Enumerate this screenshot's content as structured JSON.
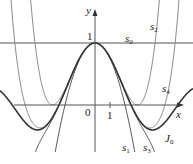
{
  "chart_data": {
    "type": "line",
    "title": "",
    "xlabel": "x",
    "ylabel": "y",
    "xlim": [
      -6.3,
      6.3
    ],
    "ylim": [
      -1.0,
      1.55
    ],
    "grid": false,
    "tick_labels": {
      "origin": "0",
      "x_one": "1",
      "y_one": "1"
    },
    "series": [
      {
        "name": "s0",
        "label": "s",
        "sub": "0",
        "coeffs": [
          1
        ],
        "stroke": "#555555",
        "width": 1.1
      },
      {
        "name": "s1",
        "label": "s",
        "sub": "1",
        "coeffs": [
          1,
          -0.25
        ],
        "stroke": "#555555",
        "width": 1.0
      },
      {
        "name": "s2",
        "label": "s",
        "sub": "2",
        "coeffs": [
          1,
          -0.25,
          0.015625
        ],
        "stroke": "#8a8a8a",
        "width": 1.0
      },
      {
        "name": "s3",
        "label": "s",
        "sub": "3",
        "coeffs": [
          1,
          -0.25,
          0.015625,
          -0.000434028
        ],
        "stroke": "#555555",
        "width": 1.0
      },
      {
        "name": "s4",
        "label": "s",
        "sub": "4",
        "coeffs": [
          1,
          -0.25,
          0.015625,
          -0.000434028,
          6.78168e-06
        ],
        "stroke": "#8a8a8a",
        "width": 1.0
      },
      {
        "name": "J0",
        "label": "J",
        "sub": "0",
        "bessel": true,
        "stroke": "#333333",
        "width": 1.6
      }
    ],
    "legend_position": "inline labels"
  },
  "labels": {
    "x_axis": "x",
    "y_axis": "y",
    "origin": "0",
    "x_tick_1": "1",
    "y_tick_1": "1",
    "s0": "s",
    "s0_sub": "0",
    "s1": "s",
    "s1_sub": "1",
    "s2": "s",
    "s2_sub": "2",
    "s3": "s",
    "s3_sub": "3",
    "s4": "s",
    "s4_sub": "4",
    "J0": "J",
    "J0_sub": "0"
  }
}
